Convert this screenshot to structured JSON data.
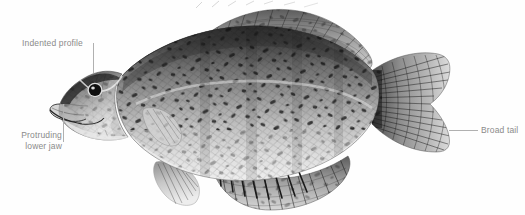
{
  "figure": {
    "background_color": "#fefefe",
    "label_color": "#8a8a8a",
    "leader_color": "#b0b0b0"
  },
  "annotations": [
    {
      "id": "indented-profile",
      "label": "Indented profile",
      "position": "upper-left",
      "leader": "vertical"
    },
    {
      "id": "protruding-lower-jaw",
      "label_line_1": "Protruding",
      "label_line_2": "lower jaw",
      "label": "Protruding lower jaw",
      "position": "lower-left",
      "leader": "vertical"
    },
    {
      "id": "broad-tail",
      "label": "Broad tail",
      "position": "right",
      "leader": "horizontal"
    }
  ],
  "illustration": {
    "title": "black-crappie",
    "parts": [
      "dorsal-fin",
      "caudal-fin",
      "anal-fin",
      "pelvic-fin",
      "pectoral-fin",
      "head",
      "eye",
      "gill-cover",
      "body-scales",
      "speckle-pattern"
    ]
  }
}
